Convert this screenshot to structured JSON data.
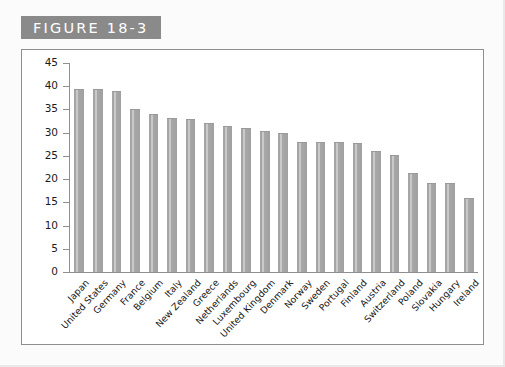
{
  "figure": {
    "badge_label": "FIGURE 18-3"
  },
  "chart_data": {
    "type": "bar",
    "title": "",
    "xlabel": "",
    "ylabel": "",
    "ylim": [
      0,
      45
    ],
    "ytick_step": 5,
    "yticks": [
      45,
      40,
      35,
      30,
      25,
      20,
      15,
      10,
      5,
      0
    ],
    "grid": false,
    "legend": null,
    "categories": [
      "Japan",
      "United States",
      "Germany",
      "France",
      "Belgium",
      "Italy",
      "New Zealand",
      "Greece",
      "Netherlands",
      "Luxembourg",
      "United Kingdom",
      "Denmark",
      "Norway",
      "Sweden",
      "Portugal",
      "Finland",
      "Austria",
      "Switzerland",
      "Poland",
      "Slovakia",
      "Hungary",
      "Ireland"
    ],
    "values": [
      39.5,
      39.4,
      39.0,
      35.0,
      34.0,
      33.2,
      33.0,
      32.0,
      31.5,
      31.0,
      30.4,
      30.0,
      28.0,
      28.0,
      28.0,
      27.8,
      26.0,
      25.2,
      21.3,
      19.2,
      19.2,
      16.0
    ],
    "colors": {
      "bar_fill": "#a5a5a5",
      "bar_highlight": "#c9c9c9",
      "axis": "#8f8f8f",
      "badge_bg": "#8a8a8a",
      "badge_text": "#ffffff",
      "page_bg": "#fbfbfb",
      "plot_bg": "#ffffff",
      "text": "#141414"
    }
  }
}
